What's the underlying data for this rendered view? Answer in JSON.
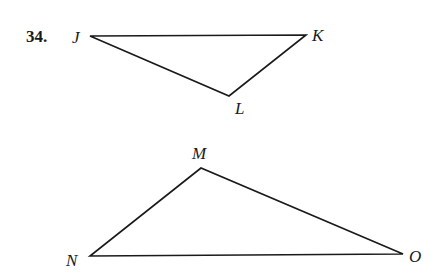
{
  "problem": {
    "number": "34."
  },
  "triangle_1": {
    "name": "JKL",
    "vertices": {
      "J": {
        "label": "J",
        "x": 90,
        "y": 36
      },
      "K": {
        "label": "K",
        "x": 306,
        "y": 35
      },
      "L": {
        "label": "L",
        "x": 229,
        "y": 96
      }
    }
  },
  "triangle_2": {
    "name": "MNO",
    "vertices": {
      "M": {
        "label": "M",
        "x": 201,
        "y": 168
      },
      "N": {
        "label": "N",
        "x": 90,
        "y": 256
      },
      "O": {
        "label": "O",
        "x": 403,
        "y": 254
      }
    }
  },
  "colors": {
    "stroke": "#1a1a1a",
    "background": "#ffffff"
  }
}
